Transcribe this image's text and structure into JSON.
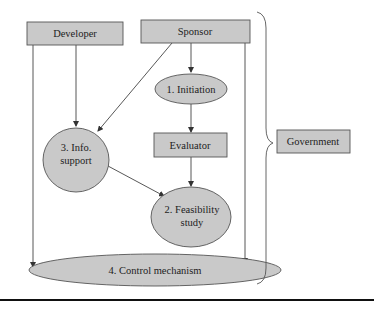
{
  "diagram": {
    "colors": {
      "node_fill": "#c9c9c9",
      "node_stroke": "#555555",
      "edge": "#444444",
      "text": "#222222",
      "rule": "#111111"
    },
    "nodes": {
      "developer": {
        "label": "Developer",
        "shape": "rect"
      },
      "sponsor": {
        "label": "Sponsor",
        "shape": "rect"
      },
      "initiation": {
        "label": "1. Initiation",
        "shape": "ellipse"
      },
      "evaluator": {
        "label": "Evaluator",
        "shape": "rect"
      },
      "info_support": {
        "label_line1": "3. Info.",
        "label_line2": "support",
        "shape": "ellipse"
      },
      "feasibility": {
        "label_line1": "2. Feasibility",
        "label_line2": "study",
        "shape": "ellipse"
      },
      "control": {
        "label": "4. Control mechanism",
        "shape": "ellipse"
      },
      "government": {
        "label": "Government",
        "shape": "rect"
      }
    },
    "edges": [
      {
        "from": "Developer",
        "to": "3. Info. support"
      },
      {
        "from": "Developer",
        "to": "4. Control mechanism"
      },
      {
        "from": "Sponsor",
        "to": "1. Initiation"
      },
      {
        "from": "Sponsor",
        "to": "3. Info. support"
      },
      {
        "from": "Sponsor",
        "to": "4. Control mechanism"
      },
      {
        "from": "1. Initiation",
        "to": "Evaluator"
      },
      {
        "from": "Evaluator",
        "to": "2. Feasibility study"
      },
      {
        "from": "3. Info. support",
        "to": "2. Feasibility study"
      }
    ],
    "brace": {
      "groups": "all nodes",
      "points_to": "Government"
    }
  }
}
